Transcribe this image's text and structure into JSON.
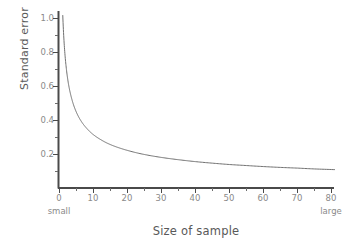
{
  "chart_data": {
    "type": "line",
    "title": "",
    "xlabel": "Size of sample",
    "ylabel": "Standard error",
    "xlim": [
      0,
      82
    ],
    "ylim": [
      0,
      1.06
    ],
    "grid": false,
    "legend": null,
    "xticks": [
      0,
      10,
      20,
      30,
      40,
      50,
      60,
      70,
      80
    ],
    "xticklabels": [
      "0",
      "10",
      "20",
      "30",
      "40",
      "50",
      "60",
      "70",
      "80"
    ],
    "xminorticks": [
      5,
      15,
      25,
      35,
      45,
      55,
      65,
      75
    ],
    "yticks": [
      0.2,
      0.4,
      0.6,
      0.8,
      1.0
    ],
    "yticklabels": [
      "0.2",
      "0.4",
      "0.6",
      "0.8",
      "1.0"
    ],
    "yminorticks": [
      0.1,
      0.3,
      0.5,
      0.7,
      0.9
    ],
    "annotations": [
      {
        "text": "small",
        "x": 0,
        "position": "below-axis-left"
      },
      {
        "text": "large",
        "x": 80,
        "position": "below-axis-right"
      }
    ],
    "series": [
      {
        "name": "standard error",
        "relation": "1/sqrt(n)",
        "x": [
          0.96,
          1.5,
          2,
          2.5,
          3,
          3.5,
          4,
          5,
          6,
          7,
          8,
          9,
          10,
          12,
          14,
          16,
          18,
          20,
          24,
          28,
          32,
          36,
          40,
          45,
          50,
          55,
          60,
          65,
          70,
          75,
          81
        ],
        "y": [
          1.02,
          0.816,
          0.707,
          0.632,
          0.577,
          0.535,
          0.5,
          0.447,
          0.408,
          0.378,
          0.354,
          0.333,
          0.316,
          0.289,
          0.267,
          0.25,
          0.236,
          0.224,
          0.204,
          0.189,
          0.177,
          0.167,
          0.158,
          0.149,
          0.141,
          0.135,
          0.129,
          0.124,
          0.12,
          0.115,
          0.111
        ]
      }
    ],
    "colors": {
      "background": "#ffffff",
      "axis": "#4a4a4a",
      "curve": "#707070",
      "tick_text": "#8a8a8a",
      "axis_label_text": "#595959"
    }
  }
}
